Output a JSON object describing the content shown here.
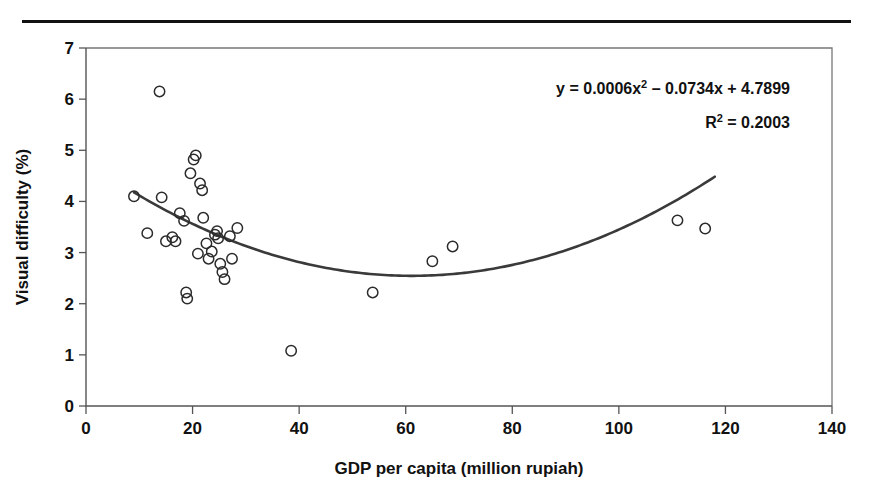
{
  "figure": {
    "has_caption_rule": true,
    "background_color": "#ffffff"
  },
  "annotations": {
    "equation_line1_a": "y = 0.0006x",
    "equation_line1_sup": "2",
    "equation_line1_b": "– 0.0734x + 4.7899",
    "equation_line2_a": "R",
    "equation_line2_sup": "2",
    "equation_line2_b": "= 0.2003",
    "equation_full": "y = 0.0006x² – 0.0734x + 4.7899",
    "r_squared_full": "R² = 0.2003"
  },
  "chart_data": {
    "type": "scatter",
    "title": "",
    "xlabel": "GDP per capita (million rupiah)",
    "ylabel": "Visual difficulty (%)",
    "xlim": [
      0,
      140
    ],
    "ylim": [
      0,
      7
    ],
    "xticks": [
      0,
      20,
      40,
      60,
      80,
      100,
      120,
      140
    ],
    "yticks": [
      0,
      1,
      2,
      3,
      4,
      5,
      6,
      7
    ],
    "xtick_labels": [
      "0",
      "20",
      "40",
      "60",
      "80",
      "100",
      "120",
      "140"
    ],
    "ytick_labels": [
      "0",
      "1",
      "2",
      "3",
      "4",
      "5",
      "6",
      "7"
    ],
    "grid": false,
    "legend": null,
    "marker_style": "open-circle",
    "marker_color": "#2b2b2b",
    "trendline_color": "#3a3a3a",
    "points": [
      {
        "x": 9.0,
        "y": 4.1
      },
      {
        "x": 11.5,
        "y": 3.38
      },
      {
        "x": 13.8,
        "y": 6.15
      },
      {
        "x": 14.2,
        "y": 4.08
      },
      {
        "x": 15.0,
        "y": 3.22
      },
      {
        "x": 16.2,
        "y": 3.3
      },
      {
        "x": 16.8,
        "y": 3.22
      },
      {
        "x": 17.6,
        "y": 3.77
      },
      {
        "x": 18.4,
        "y": 3.62
      },
      {
        "x": 18.8,
        "y": 2.22
      },
      {
        "x": 19.0,
        "y": 2.1
      },
      {
        "x": 19.6,
        "y": 4.55
      },
      {
        "x": 20.2,
        "y": 4.82
      },
      {
        "x": 20.6,
        "y": 4.9
      },
      {
        "x": 21.0,
        "y": 2.98
      },
      {
        "x": 21.4,
        "y": 4.35
      },
      {
        "x": 21.8,
        "y": 4.22
      },
      {
        "x": 22.0,
        "y": 3.68
      },
      {
        "x": 22.6,
        "y": 3.18
      },
      {
        "x": 23.0,
        "y": 2.88
      },
      {
        "x": 23.6,
        "y": 3.02
      },
      {
        "x": 24.2,
        "y": 3.35
      },
      {
        "x": 24.6,
        "y": 3.42
      },
      {
        "x": 24.8,
        "y": 3.28
      },
      {
        "x": 25.2,
        "y": 2.78
      },
      {
        "x": 25.6,
        "y": 2.62
      },
      {
        "x": 26.0,
        "y": 2.48
      },
      {
        "x": 27.0,
        "y": 3.32
      },
      {
        "x": 27.4,
        "y": 2.88
      },
      {
        "x": 28.4,
        "y": 3.48
      },
      {
        "x": 38.5,
        "y": 1.08
      },
      {
        "x": 53.8,
        "y": 2.22
      },
      {
        "x": 65.0,
        "y": 2.83
      },
      {
        "x": 68.8,
        "y": 3.12
      },
      {
        "x": 111.0,
        "y": 3.63
      },
      {
        "x": 116.2,
        "y": 3.47
      }
    ],
    "trendline": {
      "type": "quadratic",
      "coefficients": {
        "a": 0.0006,
        "b": -0.0734,
        "c": 4.7899
      },
      "r_squared": 0.2003,
      "x_start": 9,
      "x_end": 118
    }
  }
}
